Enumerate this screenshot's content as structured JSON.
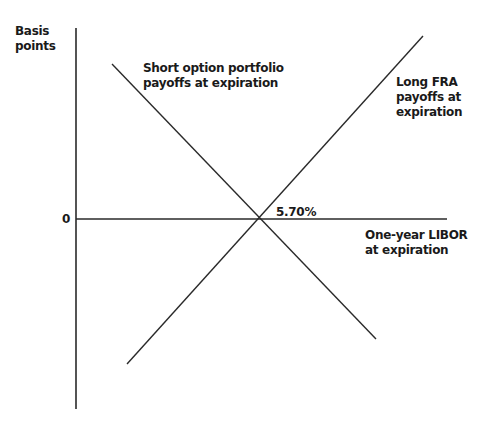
{
  "diagram": {
    "y_axis_label": [
      "Basis",
      "points"
    ],
    "zero_label": "0",
    "x_axis_label": [
      "One-year LIBOR",
      "at expiration"
    ],
    "intersection_label": "5.70%",
    "short_option_label": [
      "Short option portfolio",
      "payoffs at expiration"
    ],
    "long_fra_label": [
      "Long FRA",
      "payoffs at",
      "expiration"
    ],
    "line_color": "#1a1a1a"
  }
}
